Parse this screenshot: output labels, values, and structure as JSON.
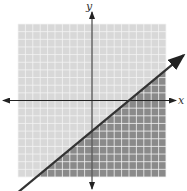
{
  "chart_data": {
    "type": "area",
    "title": "",
    "xlabel": "x",
    "ylabel": "y",
    "xlim": [
      -10,
      10
    ],
    "ylim": [
      -10,
      10
    ],
    "grid": true,
    "grid_step": 1,
    "boundary_line": {
      "style": "solid",
      "points": [
        [
          0,
          -4
        ],
        [
          5,
          0
        ]
      ],
      "slope": 0.8,
      "y_intercept": -4,
      "x_intercept": 5
    },
    "shaded_region": "below",
    "colors": {
      "unshaded": "#d8d8d8",
      "shaded": "#8a8a8a",
      "grid": "#f4f4f4",
      "axes": "#222222",
      "line": "#333333"
    }
  },
  "labels": {
    "x": "x",
    "y": "y"
  }
}
